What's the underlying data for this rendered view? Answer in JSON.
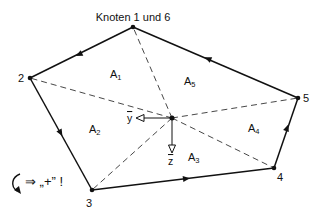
{
  "title": "Knoten 1 und 6",
  "nodes": [
    {
      "id": "1",
      "label": "Knoten 1 und 6",
      "x": 133,
      "y": 27
    },
    {
      "id": "2",
      "label": "2",
      "x": 30,
      "y": 78
    },
    {
      "id": "3",
      "label": "3",
      "x": 92,
      "y": 190
    },
    {
      "id": "4",
      "label": "4",
      "x": 274,
      "y": 168
    },
    {
      "id": "5",
      "label": "5",
      "x": 298,
      "y": 98
    }
  ],
  "center": {
    "x": 172,
    "y": 118
  },
  "areas": [
    {
      "name": "A",
      "sub": "1"
    },
    {
      "name": "A",
      "sub": "2"
    },
    {
      "name": "A",
      "sub": "3"
    },
    {
      "name": "A",
      "sub": "4"
    },
    {
      "name": "A",
      "sub": "5"
    }
  ],
  "axes": {
    "y": "y",
    "z": "z"
  },
  "rotation_note": "⇒ „+” !",
  "colors": {
    "line": "#111111",
    "background": "#ffffff"
  }
}
